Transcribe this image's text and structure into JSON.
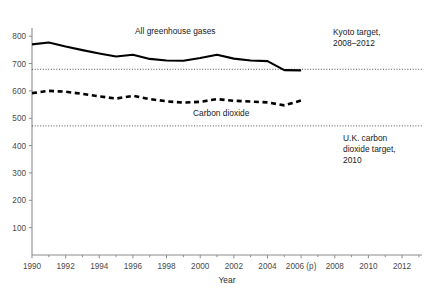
{
  "chart_data": {
    "type": "line",
    "title": "",
    "xlabel": "Year",
    "ylabel": "",
    "xlim": [
      1989.2,
      2013.4
    ],
    "ylim": [
      0,
      830
    ],
    "grid": false,
    "legend_position": "inline-annotations",
    "x_ticks": [
      "1990",
      "1992",
      "1994",
      "1996",
      "1998",
      "2000",
      "2002",
      "2004",
      "2006 (p)",
      "2008",
      "2010",
      "2012"
    ],
    "x_tick_values": [
      1990,
      1992,
      1994,
      1996,
      1998,
      2000,
      2002,
      2004,
      2006,
      2008,
      2010,
      2012
    ],
    "x_minor_tick_values": [
      1991,
      1993,
      1995,
      1997,
      1999,
      2001,
      2003,
      2005,
      2007,
      2009,
      2011,
      2013
    ],
    "y_ticks": [
      "100",
      "200",
      "300",
      "400",
      "500",
      "600",
      "700",
      "800"
    ],
    "y_tick_values": [
      100,
      200,
      300,
      400,
      500,
      600,
      700,
      800
    ],
    "x": [
      1990,
      1991,
      1992,
      1993,
      1994,
      1995,
      1996,
      1997,
      1998,
      1999,
      2000,
      2001,
      2002,
      2003,
      2004,
      2005,
      2006
    ],
    "series": [
      {
        "name": "All greenhouse gases",
        "style": "solid",
        "values": [
          770,
          777,
          762,
          749,
          737,
          726,
          732,
          717,
          711,
          710,
          720,
          732,
          718,
          711,
          709,
          676,
          675
        ]
      },
      {
        "name": "Carbon dioxide",
        "style": "dashed",
        "values": [
          592,
          600,
          597,
          589,
          580,
          572,
          582,
          570,
          562,
          557,
          560,
          570,
          564,
          561,
          558,
          547,
          565
        ]
      }
    ],
    "reference_lines": [
      {
        "name": "Kyoto target, 2008–2012",
        "value": 679,
        "style": "dotted",
        "label_lines": [
          "Kyoto target,",
          "2008–2012"
        ]
      },
      {
        "name": "U.K. carbon dioxide target, 2010",
        "value": 472,
        "style": "dotted",
        "label_lines": [
          "U.K. carbon",
          "dioxide target,",
          "2010"
        ]
      }
    ],
    "annotations": [
      {
        "name": "all-greenhouse-gases-label",
        "text": "All greenhouse gases"
      },
      {
        "name": "carbon-dioxide-label",
        "text": "Carbon dioxide"
      }
    ]
  },
  "labels": {
    "series_greenhouse": "All greenhouse gases",
    "series_co2": "Carbon dioxide",
    "kyoto_line1": "Kyoto target,",
    "kyoto_line2": "2008–2012",
    "uk_line1": "U.K. carbon",
    "uk_line2": "dioxide target,",
    "uk_line3": "2010",
    "x_axis_title": "Year"
  },
  "colors": {
    "background": "#ffffff",
    "series": "#000000",
    "axis": "#8c8c8c",
    "tick_text": "#4a4a4a",
    "reference_line": "#3d3d3d"
  }
}
